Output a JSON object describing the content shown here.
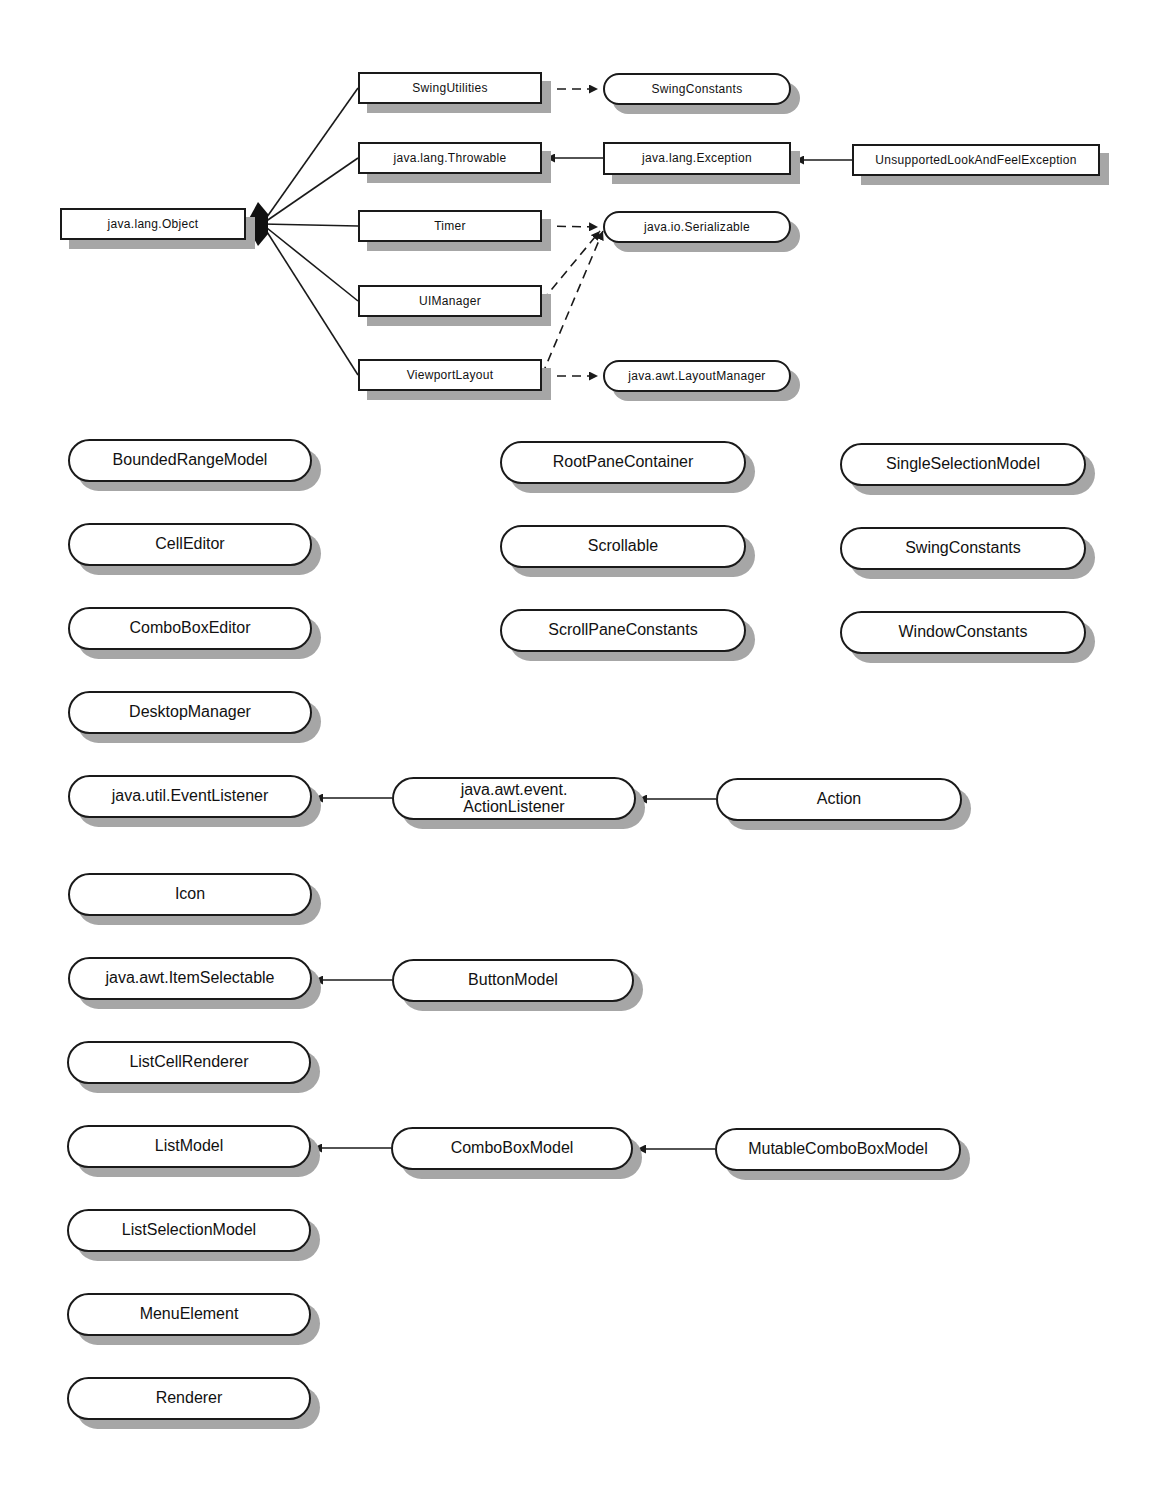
{
  "diagram": {
    "type": "uml-class-hierarchy",
    "top_section": {
      "classes": [
        {
          "id": "object",
          "label": "java.lang.Object",
          "x": 60,
          "y": 208,
          "w": 186,
          "h": 32
        },
        {
          "id": "swingutilities",
          "label": "SwingUtilities",
          "x": 358,
          "y": 72,
          "w": 184,
          "h": 32
        },
        {
          "id": "throwable",
          "label": "java.lang.Throwable",
          "x": 358,
          "y": 142,
          "w": 184,
          "h": 32
        },
        {
          "id": "timer",
          "label": "Timer",
          "x": 358,
          "y": 210,
          "w": 184,
          "h": 32
        },
        {
          "id": "uimanager",
          "label": "UIManager",
          "x": 358,
          "y": 285,
          "w": 184,
          "h": 32
        },
        {
          "id": "viewportlayout",
          "label": "ViewportLayout",
          "x": 358,
          "y": 359,
          "w": 184,
          "h": 32
        },
        {
          "id": "exception",
          "label": "java.lang.Exception",
          "x": 603,
          "y": 142,
          "w": 188,
          "h": 33
        },
        {
          "id": "unsupportedlaf",
          "label": "UnsupportedLookAndFeelException",
          "x": 852,
          "y": 144,
          "w": 248,
          "h": 32
        }
      ],
      "interfaces": [
        {
          "id": "swingconstants_top",
          "label": "SwingConstants",
          "x": 603,
          "y": 73,
          "w": 188,
          "h": 32
        },
        {
          "id": "serializable",
          "label": "java.io.Serializable",
          "x": 603,
          "y": 211,
          "w": 188,
          "h": 32
        },
        {
          "id": "layoutmanager",
          "label": "java.awt.LayoutManager",
          "x": 603,
          "y": 360,
          "w": 188,
          "h": 32
        }
      ],
      "relations": [
        {
          "from": "swingutilities",
          "to": "object",
          "kind": "extends"
        },
        {
          "from": "throwable",
          "to": "object",
          "kind": "extends"
        },
        {
          "from": "timer",
          "to": "object",
          "kind": "extends"
        },
        {
          "from": "uimanager",
          "to": "object",
          "kind": "extends"
        },
        {
          "from": "viewportlayout",
          "to": "object",
          "kind": "extends"
        },
        {
          "from": "swingutilities",
          "to": "swingconstants_top",
          "kind": "implements"
        },
        {
          "from": "exception",
          "to": "throwable",
          "kind": "extends"
        },
        {
          "from": "unsupportedlaf",
          "to": "exception",
          "kind": "extends"
        },
        {
          "from": "timer",
          "to": "serializable",
          "kind": "implements"
        },
        {
          "from": "uimanager",
          "to": "serializable",
          "kind": "implements"
        },
        {
          "from": "viewportlayout",
          "to": "serializable",
          "kind": "implements"
        },
        {
          "from": "viewportlayout",
          "to": "layoutmanager",
          "kind": "implements"
        }
      ]
    },
    "interfaces": [
      {
        "id": "boundedrangemodel",
        "label": "BoundedRangeModel",
        "x": 68,
        "y": 439,
        "w": 244,
        "h": 43
      },
      {
        "id": "celleditor",
        "label": "CellEditor",
        "x": 68,
        "y": 523,
        "w": 244,
        "h": 43
      },
      {
        "id": "comboboxeditor",
        "label": "ComboBoxEditor",
        "x": 68,
        "y": 607,
        "w": 244,
        "h": 43
      },
      {
        "id": "desktopmanager",
        "label": "DesktopManager",
        "x": 68,
        "y": 691,
        "w": 244,
        "h": 43
      },
      {
        "id": "eventlistener",
        "label": "java.util.EventListener",
        "x": 68,
        "y": 775,
        "w": 244,
        "h": 43
      },
      {
        "id": "icon",
        "label": "Icon",
        "x": 68,
        "y": 873,
        "w": 244,
        "h": 43
      },
      {
        "id": "itemselectable",
        "label": "java.awt.ItemSelectable",
        "x": 68,
        "y": 957,
        "w": 244,
        "h": 43
      },
      {
        "id": "listcellrenderer",
        "label": "ListCellRenderer",
        "x": 67,
        "y": 1041,
        "w": 244,
        "h": 43
      },
      {
        "id": "listmodel",
        "label": "ListModel",
        "x": 67,
        "y": 1125,
        "w": 244,
        "h": 43
      },
      {
        "id": "listselectionmodel",
        "label": "ListSelectionModel",
        "x": 67,
        "y": 1209,
        "w": 244,
        "h": 43
      },
      {
        "id": "menuelement",
        "label": "MenuElement",
        "x": 67,
        "y": 1293,
        "w": 244,
        "h": 43
      },
      {
        "id": "renderer",
        "label": "Renderer",
        "x": 67,
        "y": 1377,
        "w": 244,
        "h": 43
      },
      {
        "id": "rootpanecontainer",
        "label": "RootPaneContainer",
        "x": 500,
        "y": 441,
        "w": 246,
        "h": 43
      },
      {
        "id": "scrollable",
        "label": "Scrollable",
        "x": 500,
        "y": 525,
        "w": 246,
        "h": 43
      },
      {
        "id": "scrollpaneconstants",
        "label": "ScrollPaneConstants",
        "x": 500,
        "y": 609,
        "w": 246,
        "h": 43
      },
      {
        "id": "singleselectionmodel",
        "label": "SingleSelectionModel",
        "x": 840,
        "y": 443,
        "w": 246,
        "h": 43
      },
      {
        "id": "swingconstants",
        "label": "SwingConstants",
        "x": 840,
        "y": 527,
        "w": 246,
        "h": 43
      },
      {
        "id": "windowconstants",
        "label": "WindowConstants",
        "x": 840,
        "y": 611,
        "w": 246,
        "h": 43
      },
      {
        "id": "actionlistener",
        "label": "java.awt.event.\nActionListener",
        "x": 392,
        "y": 777,
        "w": 244,
        "h": 43
      },
      {
        "id": "action",
        "label": "Action",
        "x": 716,
        "y": 778,
        "w": 246,
        "h": 43
      },
      {
        "id": "buttonmodel",
        "label": "ButtonModel",
        "x": 392,
        "y": 959,
        "w": 242,
        "h": 43
      },
      {
        "id": "comboboxmodel",
        "label": "ComboBoxModel",
        "x": 391,
        "y": 1127,
        "w": 242,
        "h": 43
      },
      {
        "id": "mutablecomboboxmodel",
        "label": "MutableComboBoxModel",
        "x": 715,
        "y": 1128,
        "w": 246,
        "h": 43
      }
    ],
    "interface_relations": [
      {
        "from": "actionlistener",
        "to": "eventlistener",
        "kind": "extends"
      },
      {
        "from": "action",
        "to": "actionlistener",
        "kind": "extends"
      },
      {
        "from": "buttonmodel",
        "to": "itemselectable",
        "kind": "extends"
      },
      {
        "from": "comboboxmodel",
        "to": "listmodel",
        "kind": "extends"
      },
      {
        "from": "mutablecomboboxmodel",
        "to": "comboboxmodel",
        "kind": "extends"
      }
    ],
    "colors": {
      "line": "#1a1a1a",
      "shadow": "#a6a6a6",
      "fill": "#ffffff"
    }
  }
}
